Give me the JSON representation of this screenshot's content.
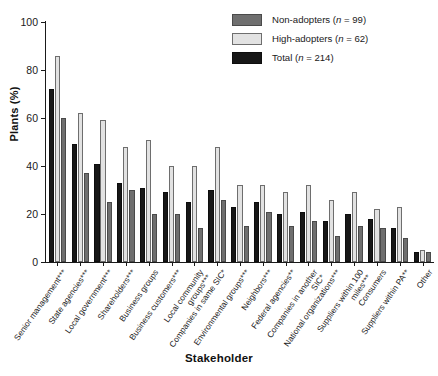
{
  "chart_data": {
    "type": "bar",
    "title": "",
    "xlabel": "Stakeholder",
    "ylabel": "Plants (%)",
    "ylim": [
      0,
      100
    ],
    "yticks": [
      0,
      20,
      40,
      60,
      80,
      100
    ],
    "grid": false,
    "legend_position": "top-right",
    "orientation": "vertical",
    "group_mode": "grouped",
    "bar_order": [
      "Total",
      "High-adopters",
      "Non-adopters"
    ],
    "categories": [
      "Senior management***",
      "State agencies***",
      "Local government***",
      "Shareholders***",
      "Business groups",
      "Business customers***",
      "Local community groups***",
      "Companies in same SIC*",
      "Environmental groups***",
      "Neighbors***",
      "Federal agencies**",
      "Companies in another SIC*",
      "National organizations***",
      "Suppliers within 100 miles***",
      "Consumers",
      "Suppliers within PA**",
      "Other"
    ],
    "series": [
      {
        "name": "Non-adopters",
        "n": 99,
        "color": "#6f6f6f",
        "values": [
          60,
          37,
          25,
          30,
          20,
          20,
          14,
          26,
          15,
          21,
          15,
          17,
          11,
          15,
          14,
          10,
          4
        ]
      },
      {
        "name": "High-adopters",
        "n": 62,
        "color": "#e2e2e2",
        "values": [
          86,
          62,
          59,
          48,
          51,
          40,
          40,
          48,
          32,
          32,
          29,
          32,
          26,
          29,
          22,
          23,
          5
        ]
      },
      {
        "name": "Total",
        "n": 214,
        "color": "#171717",
        "values": [
          72,
          49,
          41,
          33,
          31,
          29,
          25,
          30,
          23,
          25,
          20,
          21,
          17,
          20,
          18,
          14,
          4
        ]
      }
    ]
  },
  "legend": {
    "items": [
      {
        "label_prefix": "Non-adopters (",
        "n_text": "n",
        "label_suffix": " = 99)",
        "swatch": "non"
      },
      {
        "label_prefix": "High-adopters (",
        "n_text": "n",
        "label_suffix": " = 62)",
        "swatch": "high"
      },
      {
        "label_prefix": "Total (",
        "n_text": "n",
        "label_suffix": " = 214)",
        "swatch": "total"
      }
    ]
  }
}
